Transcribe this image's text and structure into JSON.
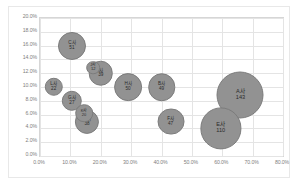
{
  "chart_data": {
    "type": "scatter",
    "title": "",
    "xlabel": "",
    "ylabel": "",
    "xlim": [
      0,
      80
    ],
    "ylim": [
      0,
      20
    ],
    "grid": true,
    "legend": "none",
    "x_ticks": [
      "0.0%",
      "10.0%",
      "20.0%",
      "30.0%",
      "40.0%",
      "50.0%",
      "60.0%",
      "70.0%",
      "80.0%"
    ],
    "y_ticks": [
      "0.0%",
      "2.0%",
      "4.0%",
      "6.0%",
      "8.0%",
      "10.0%",
      "12.0%",
      "14.0%",
      "16.0%",
      "18.0%",
      "20.0%"
    ],
    "bubbles": [
      {
        "label": "A사",
        "value": "143",
        "x": 66.0,
        "y": 8.9,
        "size": 143
      },
      {
        "label": "E사",
        "value": "110",
        "x": 59.5,
        "y": 4.0,
        "size": 110
      },
      {
        "label": "C사",
        "value": "51",
        "x": 10.5,
        "y": 16.0,
        "size": 51
      },
      {
        "label": "B사",
        "value": "49",
        "x": 40.0,
        "y": 10.0,
        "size": 49
      },
      {
        "label": "F사",
        "value": "47",
        "x": 43.0,
        "y": 5.0,
        "size": 47
      },
      {
        "label": "H사",
        "value": "50",
        "x": 29.0,
        "y": 10.0,
        "size": 50
      },
      {
        "label": "I사",
        "value": "39",
        "x": 20.0,
        "y": 12.0,
        "size": 39
      },
      {
        "label": "J사",
        "value": "12",
        "x": 17.5,
        "y": 12.8,
        "size": 12
      },
      {
        "label": "D사",
        "value": "38",
        "x": 15.5,
        "y": 5.0,
        "size": 38
      },
      {
        "label": "K사",
        "value": "20",
        "x": 14.5,
        "y": 6.2,
        "size": 20
      },
      {
        "label": "G사",
        "value": "27",
        "x": 10.5,
        "y": 8.0,
        "size": 27
      },
      {
        "label": "L사",
        "value": "22",
        "x": 4.5,
        "y": 10.0,
        "size": 22
      }
    ]
  }
}
